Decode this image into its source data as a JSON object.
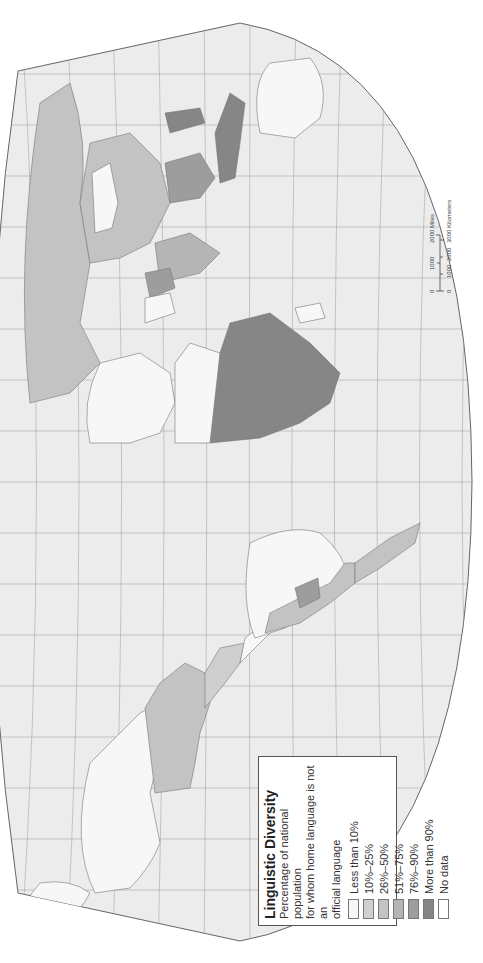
{
  "map": {
    "orientation": "rotated, north to left",
    "background_ocean": "#ececec",
    "graticule_color": "#9a9a9a",
    "border_color": "#777777"
  },
  "legend": {
    "title": "Linguistic Diversity",
    "subtitle_lines": [
      "Percentage of national population",
      "for whom home language is not an",
      "official language"
    ],
    "classes": [
      {
        "label": "Less than 10%",
        "color": "#f7f7f7"
      },
      {
        "label": "10%–25%",
        "color": "#cfcfcf"
      },
      {
        "label": "26%–50%",
        "color": "#c3c3c3"
      },
      {
        "label": "51%–75%",
        "color": "#b5b5b5"
      },
      {
        "label": "76%–90%",
        "color": "#9d9d9d"
      },
      {
        "label": "More than 90%",
        "color": "#868686"
      },
      {
        "label": "No data",
        "color": "#ffffff"
      }
    ]
  },
  "scale": {
    "miles_labels": [
      "0",
      "1000",
      "2000 Miles"
    ],
    "km_labels": [
      "0",
      "1000",
      "2000",
      "3000 Kilometers"
    ]
  },
  "regions": [
    {
      "name": "north-america-canada",
      "class": 0
    },
    {
      "name": "united-states",
      "class": 2
    },
    {
      "name": "mexico",
      "class": 1
    },
    {
      "name": "central-america",
      "class": 0
    },
    {
      "name": "brazil",
      "class": 0
    },
    {
      "name": "andes",
      "class": 2
    },
    {
      "name": "bolivia",
      "class": 4
    },
    {
      "name": "russia",
      "class": 2
    },
    {
      "name": "china",
      "class": 2
    },
    {
      "name": "mongolia",
      "class": 0
    },
    {
      "name": "india",
      "class": 3
    },
    {
      "name": "pakistan-afghanistan",
      "class": 4
    },
    {
      "name": "iran",
      "class": 0
    },
    {
      "name": "europe",
      "class": 0
    },
    {
      "name": "north-africa",
      "class": 0
    },
    {
      "name": "sub-saharan-africa",
      "class": 5
    },
    {
      "name": "madagascar",
      "class": 0
    },
    {
      "name": "southeast-asia",
      "class": 4
    },
    {
      "name": "indonesia",
      "class": 5
    },
    {
      "name": "philippines",
      "class": 5
    },
    {
      "name": "australia",
      "class": 0
    },
    {
      "name": "greenland",
      "class": 0
    }
  ]
}
